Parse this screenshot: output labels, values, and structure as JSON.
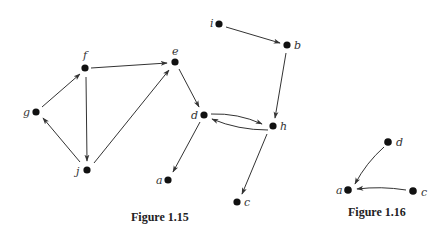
{
  "figures": [
    {
      "caption": "Figure 1.15",
      "nodes": [
        {
          "id": "i",
          "label": "i"
        },
        {
          "id": "b",
          "label": "b"
        },
        {
          "id": "e",
          "label": "e"
        },
        {
          "id": "f",
          "label": "f"
        },
        {
          "id": "g",
          "label": "g"
        },
        {
          "id": "d",
          "label": "d"
        },
        {
          "id": "h",
          "label": "h"
        },
        {
          "id": "j",
          "label": "j"
        },
        {
          "id": "a",
          "label": "a"
        },
        {
          "id": "c",
          "label": "c"
        }
      ],
      "edges": [
        {
          "from": "i",
          "to": "b"
        },
        {
          "from": "b",
          "to": "h"
        },
        {
          "from": "f",
          "to": "e"
        },
        {
          "from": "g",
          "to": "f"
        },
        {
          "from": "f",
          "to": "j"
        },
        {
          "from": "j",
          "to": "g"
        },
        {
          "from": "j",
          "to": "e"
        },
        {
          "from": "e",
          "to": "d"
        },
        {
          "from": "d",
          "to": "h"
        },
        {
          "from": "h",
          "to": "d"
        },
        {
          "from": "d",
          "to": "a"
        },
        {
          "from": "h",
          "to": "c"
        }
      ]
    },
    {
      "caption": "Figure 1.16",
      "nodes": [
        {
          "id": "d",
          "label": "d"
        },
        {
          "id": "a",
          "label": "a"
        },
        {
          "id": "c",
          "label": "c"
        }
      ],
      "edges": [
        {
          "from": "d",
          "to": "a"
        },
        {
          "from": "c",
          "to": "a"
        }
      ]
    }
  ]
}
